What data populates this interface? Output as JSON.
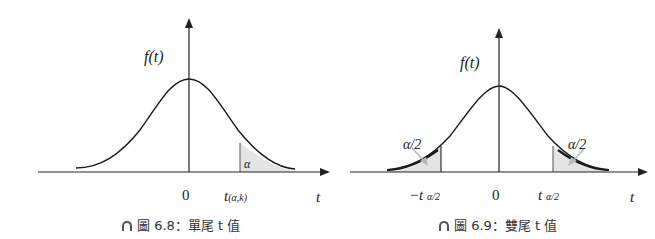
{
  "figures": [
    {
      "id": "fig-6-8",
      "y_label": "f(t)",
      "x_label": "t",
      "origin_label": "0",
      "critical_label_main": "t",
      "critical_label_sub": "(α,k)",
      "area_label": "α",
      "caption_prefix": "圖 6.8：",
      "caption_text": "單尾 t 值"
    },
    {
      "id": "fig-6-9",
      "y_label": "f(t)",
      "x_label": "t",
      "origin_label": "0",
      "left_critical_label_main": "−t",
      "left_critical_label_sub": "α/2",
      "right_critical_label_main": "t",
      "right_critical_label_sub": "α/2",
      "left_area_label": "α/2",
      "right_area_label": "α/2",
      "caption_prefix": "圖 6.9：",
      "caption_text": "雙尾 t 值"
    }
  ],
  "colors": {
    "curve": "#1a1a1a",
    "axis": "#222222",
    "shade": "#e4e4e4",
    "arrow_pointer": "#b8b8b8"
  }
}
